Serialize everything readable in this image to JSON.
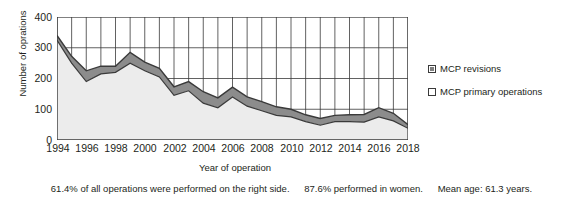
{
  "axes": {
    "y_title": "Number of oprations",
    "x_title": "Year of operation",
    "y_ticks": [
      "400",
      "300",
      "200",
      "100",
      "0"
    ],
    "x_ticks": [
      "1994",
      "1996",
      "1998",
      "2000",
      "2002",
      "2004",
      "2006",
      "2008",
      "2010",
      "2012",
      "2014",
      "2016",
      "2018"
    ]
  },
  "legend": {
    "items": [
      {
        "label": "MCP revisions",
        "color": "#808080",
        "swatch": "revisions-swatch"
      },
      {
        "label": "MCP primary operations",
        "color": "#e8e8e8",
        "swatch": "primary-swatch"
      }
    ]
  },
  "footnote": {
    "right_side": "61.4% of all operations were performed on the right side.",
    "women": "87.6% performed in women.",
    "mean_age": "Mean age: 61.3 years."
  },
  "chart_data": {
    "type": "area",
    "stacked": true,
    "title": "",
    "xlabel": "Year of operation",
    "ylabel": "Number of oprations",
    "ylim": [
      0,
      400
    ],
    "ytick_values": [
      0,
      100,
      200,
      300,
      400
    ],
    "grid": "both",
    "legend_position": "right",
    "x": [
      1994,
      1995,
      1996,
      1997,
      1998,
      1999,
      2000,
      2001,
      2002,
      2003,
      2004,
      2005,
      2006,
      2007,
      2008,
      2009,
      2010,
      2011,
      2012,
      2013,
      2014,
      2015,
      2016,
      2017,
      2018
    ],
    "series": [
      {
        "name": "MCP primary operations",
        "color": "#e8e8e8",
        "values": [
          325,
          250,
          190,
          215,
          220,
          250,
          225,
          205,
          145,
          160,
          120,
          105,
          140,
          110,
          95,
          80,
          75,
          60,
          48,
          60,
          60,
          58,
          75,
          62,
          38
        ]
      },
      {
        "name": "MCP revisions",
        "color": "#808080",
        "values": [
          15,
          22,
          35,
          25,
          20,
          35,
          28,
          28,
          28,
          30,
          37,
          32,
          32,
          30,
          30,
          28,
          25,
          22,
          22,
          20,
          22,
          25,
          30,
          25,
          12
        ]
      }
    ],
    "totals": [
      340,
      272,
      225,
      240,
      240,
      285,
      253,
      233,
      173,
      190,
      157,
      137,
      172,
      140,
      125,
      108,
      100,
      82,
      70,
      80,
      82,
      83,
      105,
      87,
      50
    ]
  }
}
